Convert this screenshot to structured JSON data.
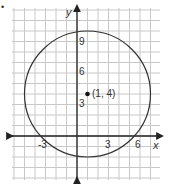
{
  "graph": {
    "bullet": "•",
    "axis_labels": {
      "x": "x",
      "y": "y"
    },
    "x_ticks": [
      {
        "value": -3,
        "label": "-3"
      },
      {
        "value": 3,
        "label": "3"
      },
      {
        "value": 6,
        "label": "6"
      }
    ],
    "y_ticks": [
      {
        "value": 3,
        "label": "3"
      },
      {
        "value": 6,
        "label": "6"
      },
      {
        "value": 9,
        "label": "9"
      }
    ],
    "center": {
      "x": 1,
      "y": 4,
      "label": "(1, 4)"
    },
    "radius": 6,
    "grid": {
      "x_min": -6,
      "x_max": 8,
      "y_min": -4,
      "y_max": 12
    },
    "colors": {
      "grid": "#c8c8c8",
      "axis": "#222222",
      "curve": "#333333"
    }
  }
}
